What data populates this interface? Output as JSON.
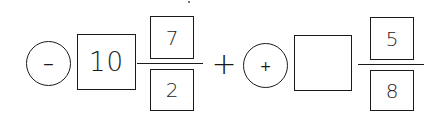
{
  "expression": {
    "term1": {
      "sign": "−",
      "whole": "10",
      "numerator": "7",
      "denominator": "2"
    },
    "operator": "+",
    "term2": {
      "sign": "+",
      "whole": "",
      "numerator": "5",
      "denominator": "8"
    }
  },
  "colors": {
    "ink": "#1a1a1a",
    "background": "#ffffff"
  }
}
